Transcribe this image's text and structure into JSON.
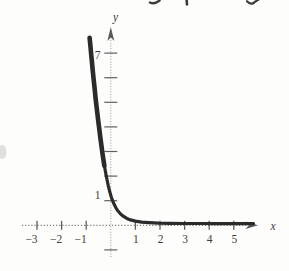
{
  "figure": {
    "kind": "scanned textbook exponential graph",
    "top_edge_has_cropped_text_fragments": true
  },
  "chart_data": {
    "type": "line",
    "title": "",
    "xlabel": "x",
    "ylabel": "y",
    "xlim": [
      -3.6,
      6.1
    ],
    "ylim": [
      -1.6,
      8.1
    ],
    "grid": false,
    "legend": null,
    "axes_style": "dotted with arrowheads on positive ends",
    "x_tick_values": [
      -3,
      -2,
      -1,
      1,
      2,
      3,
      4,
      5
    ],
    "x_tick_labels": [
      "−3",
      "−2",
      "−1",
      "1",
      "2",
      "3",
      "4",
      "5"
    ],
    "y_labeled_tick_values": [
      7,
      1
    ],
    "y_labeled_tick_labels": [
      "7",
      "1"
    ],
    "y_unlabeled_tick_values": [
      6,
      5,
      4,
      3,
      2,
      -1
    ],
    "series": [
      {
        "name": "exponential-decay-curve",
        "description": "Decreasing exponential: y ≈ 7.6 at x ≈ -0.85, passes through (0, 1), asymptotic to y = 0 for positive x",
        "points": [
          [
            -0.86,
            7.62
          ],
          [
            -0.83,
            7.3
          ],
          [
            -0.8,
            6.98
          ],
          [
            -0.77,
            6.66
          ],
          [
            -0.74,
            6.34
          ],
          [
            -0.7,
            5.95
          ],
          [
            -0.66,
            5.57
          ],
          [
            -0.62,
            5.2
          ],
          [
            -0.58,
            4.84
          ],
          [
            -0.54,
            4.5
          ],
          [
            -0.5,
            4.16
          ],
          [
            -0.46,
            3.84
          ],
          [
            -0.42,
            3.52
          ],
          [
            -0.38,
            3.22
          ],
          [
            -0.34,
            2.94
          ],
          [
            -0.3,
            2.67
          ],
          [
            -0.26,
            2.42
          ],
          [
            -0.22,
            2.19
          ],
          [
            -0.18,
            1.98
          ],
          [
            -0.14,
            1.78
          ],
          [
            -0.1,
            1.6
          ],
          [
            -0.06,
            1.44
          ],
          [
            -0.02,
            1.28
          ],
          [
            0.02,
            1.15
          ],
          [
            0.08,
            0.98
          ],
          [
            0.15,
            0.82
          ],
          [
            0.22,
            0.69
          ],
          [
            0.3,
            0.57
          ],
          [
            0.4,
            0.46
          ],
          [
            0.52,
            0.36
          ],
          [
            0.65,
            0.28
          ],
          [
            0.8,
            0.22
          ],
          [
            1.0,
            0.17
          ],
          [
            1.25,
            0.13
          ],
          [
            1.55,
            0.11
          ],
          [
            1.95,
            0.09
          ],
          [
            2.4,
            0.08
          ],
          [
            3.0,
            0.075
          ],
          [
            3.6,
            0.072
          ],
          [
            4.2,
            0.07
          ],
          [
            4.8,
            0.07
          ],
          [
            5.4,
            0.07
          ],
          [
            5.8,
            0.07
          ]
        ]
      }
    ]
  },
  "colors": {
    "paper": "#fdfdfc",
    "curve": "#2b2b2b",
    "x_axis": "#7f7f7f",
    "y_axis": "#979797",
    "tick": "#5f5f5f",
    "label": "#3f3b38",
    "arrow": "#5a5a5a",
    "fragment": "#3a3a3a",
    "smudge": "#c9c9c9"
  }
}
